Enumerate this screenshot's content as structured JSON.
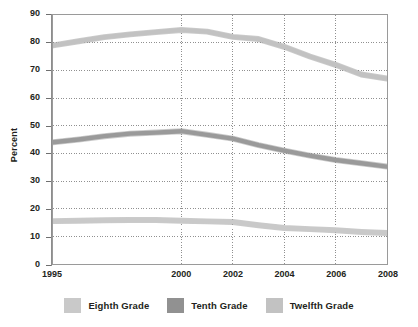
{
  "chart_data": {
    "type": "line",
    "title": "",
    "xlabel": "",
    "ylabel": "Percent",
    "xlim": [
      1995,
      2008
    ],
    "ylim": [
      0,
      90
    ],
    "ytick_step": 10,
    "yticks": [
      0,
      10,
      20,
      30,
      40,
      50,
      60,
      70,
      80,
      90
    ],
    "xticks": [
      1995,
      2000,
      2002,
      2004,
      2006,
      2008
    ],
    "xtick_labels": [
      "1995",
      "2000",
      "2002",
      "2004",
      "2006",
      "2008"
    ],
    "grid": "dotted horizontal and vertical",
    "legend_position": "below",
    "x": [
      1995,
      1996,
      1997,
      1998,
      1999,
      2000,
      2001,
      2002,
      2003,
      2004,
      2005,
      2006,
      2007,
      2008
    ],
    "series": [
      {
        "name": "Eighth Grade",
        "color": "#c9c9c9",
        "values": [
          15.5,
          15.6,
          15.8,
          15.9,
          15.9,
          15.6,
          15.4,
          15.2,
          14.0,
          13.0,
          12.6,
          12.2,
          11.6,
          11.2
        ]
      },
      {
        "name": "Tenth Grade",
        "color": "#9a9a9a",
        "values": [
          44.0,
          45.0,
          46.2,
          47.1,
          47.5,
          48.0,
          46.7,
          45.3,
          43.0,
          41.0,
          39.2,
          37.6,
          36.4,
          35.2
        ]
      },
      {
        "name": "Twelfth Grade",
        "color": "#c2c2c2",
        "values": [
          79.0,
          80.5,
          82.0,
          83.0,
          83.8,
          84.6,
          84.0,
          82.1,
          81.3,
          78.5,
          75.0,
          72.0,
          68.5,
          67.0
        ]
      }
    ]
  },
  "axis": {
    "y_title": "Percent",
    "y_labels": [
      "90",
      "80",
      "70",
      "60",
      "50",
      "40",
      "30",
      "20",
      "10",
      "0"
    ],
    "x_labels": [
      "1995",
      "2000",
      "2002",
      "2004",
      "2006",
      "2008"
    ]
  },
  "legend": {
    "items": [
      {
        "label": "Eighth Grade",
        "color": "#c9c9c9"
      },
      {
        "label": "Tenth Grade",
        "color": "#919191"
      },
      {
        "label": "Twelfth Grade",
        "color": "#c2c2c2"
      }
    ]
  }
}
